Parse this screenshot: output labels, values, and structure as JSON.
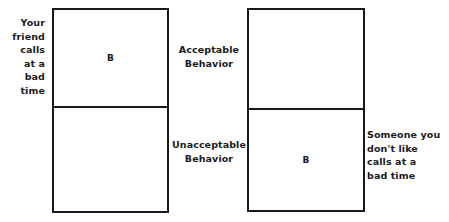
{
  "diagram": {
    "zones": {
      "acceptable_label": "Acceptable\nBehavior",
      "unacceptable_label": "Unacceptable\nBehavior"
    },
    "windows": [
      {
        "id": "left",
        "situation_label": "Your\nfriend\ncalls\nat a\nbad\ntime",
        "situation_align": "right",
        "upper_cell_marker": "B",
        "lower_cell_marker": "",
        "marker_zone": "acceptable"
      },
      {
        "id": "right",
        "situation_label": "Someone you\ndon't like\ncalls at a\nbad time",
        "situation_align": "left",
        "upper_cell_marker": "",
        "lower_cell_marker": "B",
        "marker_zone": "unacceptable"
      }
    ],
    "colors": {
      "background": "#ffffff",
      "ink": "#1a1a1a",
      "border": "#1a1a1a"
    }
  }
}
